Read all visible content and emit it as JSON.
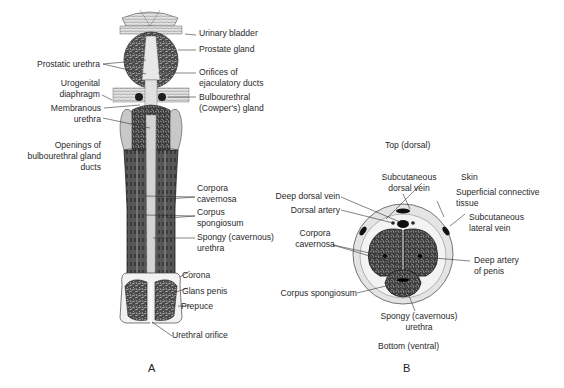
{
  "figure": {
    "panel_a": {
      "letter": "A",
      "title": "Longitudinal section",
      "labels_right": [
        "Urinary bladder",
        "Prostate gland",
        "Orifices of",
        "ejaculatory ducts",
        "Bulbourethral",
        "(Cowper's) gland",
        "Corpora",
        "cavernosa",
        "Corpus",
        "spongiosum",
        "Spongy (cavernous)",
        "urethra",
        "Corona",
        "Glans penis",
        "Prepuce",
        "Urethral orifice"
      ],
      "labels_left": [
        "Prostatic urethra",
        "Urogenital",
        "diaphragm",
        "Membranous",
        "urethra",
        "Openings of",
        "bulbourethral gland",
        "ducts"
      ]
    },
    "panel_b": {
      "letter": "B",
      "orientation_top": "Top (dorsal)",
      "orientation_bottom": "Bottom (ventral)",
      "labels": [
        "Subcutaneous",
        "dorsal vein",
        "Skin",
        "Superficial connective",
        "tissue",
        "Subcutaneous",
        "lateral vein",
        "Deep dorsal vein",
        "Dorsal artery",
        "Corpora",
        "cavernosa",
        "Deep artery",
        "of penis",
        "Corpus spongiosum",
        "Spongy (cavernous)",
        "urethra"
      ]
    },
    "colors": {
      "ink": "#231f20",
      "tissue_dark": "#3a3a3a",
      "tissue_mid": "#8c8c8c",
      "tissue_light": "#d9d9d9",
      "skin": "#e6e6e6"
    }
  }
}
